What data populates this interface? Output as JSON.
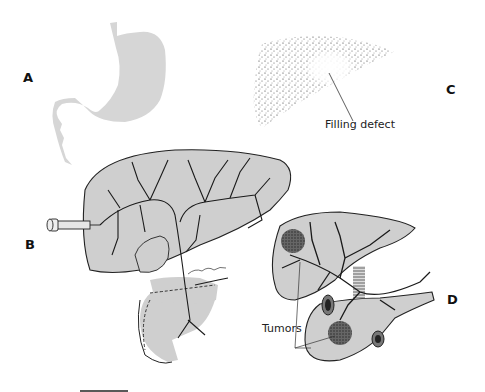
{
  "figure": {
    "panels": [
      {
        "id": "A",
        "label": "A",
        "subject": "stomach silhouette"
      },
      {
        "id": "B",
        "label": "B",
        "subject": "liver with syringe injecting contrast into biliary tree; duodenum below"
      },
      {
        "id": "C",
        "label": "C",
        "subject": "stippled liver scan",
        "annotation": "Filling defect"
      },
      {
        "id": "D",
        "label": "D",
        "subject": "liver, pancreas and duodenum with vasculature",
        "annotation": "Tumors"
      }
    ],
    "colors": {
      "organ_fill": "#cfcfcf",
      "stomach_fill": "#d6d6d6",
      "outline": "#222222",
      "vessel": "#1a1a1a",
      "background": "#ffffff"
    },
    "scale_bar": {
      "visible": true
    }
  }
}
